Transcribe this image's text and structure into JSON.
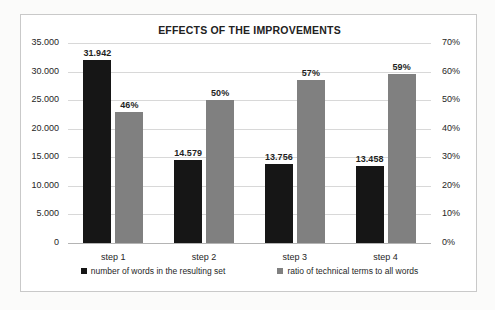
{
  "chart_data": {
    "type": "bar",
    "title": "EFFECTS OF THE IMPROVEMENTS",
    "xlabel": "",
    "ylabel": "",
    "grid": true,
    "legend_position": "bottom",
    "categories": [
      "step 1",
      "step 2",
      "step 3",
      "step 4"
    ],
    "series": [
      {
        "name": "number of words in the resulting set",
        "axis": "left",
        "color": "#161616",
        "values": [
          31942,
          14579,
          13756,
          13458
        ],
        "labels": [
          "31.942",
          "14.579",
          "13.756",
          "13.458"
        ]
      },
      {
        "name": "ratio of technical terms to all words",
        "axis": "right",
        "color": "#808080",
        "values": [
          46,
          50,
          57,
          59
        ],
        "labels": [
          "46%",
          "50%",
          "57%",
          "59%"
        ]
      }
    ],
    "left_axis": {
      "ylim": [
        0,
        35000
      ],
      "ticks": [
        35000,
        30000,
        25000,
        20000,
        15000,
        10000,
        5000,
        0
      ],
      "tick_labels": [
        "35.000",
        "30.000",
        "25.000",
        "20.000",
        "15.000",
        "10.000",
        "5.000",
        "0"
      ]
    },
    "right_axis": {
      "ylim": [
        0,
        70
      ],
      "ticks": [
        70,
        60,
        50,
        40,
        30,
        20,
        10,
        0
      ],
      "tick_labels": [
        "70%",
        "60%",
        "50%",
        "40%",
        "30%",
        "20%",
        "10%",
        "0%"
      ]
    }
  }
}
